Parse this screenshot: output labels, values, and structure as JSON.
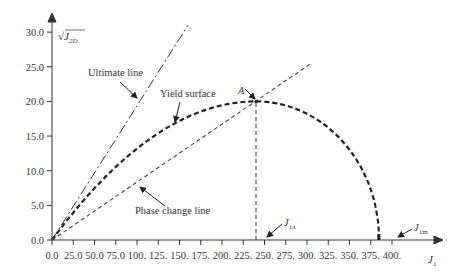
{
  "chart_data": {
    "type": "line",
    "title": "",
    "xlabel": "J1",
    "ylabel": "√J2D",
    "xlim": [
      0,
      410
    ],
    "ylim": [
      0,
      31
    ],
    "grid": false,
    "x_ticks": [
      "0.0",
      "25.0",
      "50.0",
      "75.0",
      "100.",
      "125.",
      "150.",
      "175.",
      "200.",
      "225.",
      "250.",
      "275.",
      "300.",
      "325.",
      "350.",
      "375.",
      "400."
    ],
    "x_tick_values": [
      0,
      25,
      50,
      75,
      100,
      125,
      150,
      175,
      200,
      225,
      250,
      275,
      300,
      325,
      350,
      375,
      400
    ],
    "y_ticks": [
      "0.0",
      "5.0",
      "10.0",
      "15.0",
      "20.0",
      "25.0",
      "30.0"
    ],
    "y_tick_values": [
      0,
      5,
      10,
      15,
      20,
      25,
      30
    ],
    "series": [
      {
        "name": "Ultimate line",
        "style": "dash-dot",
        "x": [
          0,
          160
        ],
        "y": [
          0,
          31
        ]
      },
      {
        "name": "Yield surface",
        "style": "thick-dashed",
        "description": "ellipse-like cap, rising from origin to peak A then falling to J1m",
        "x": [
          0,
          60,
          120,
          180,
          240,
          300,
          340,
          370,
          385
        ],
        "y": [
          0,
          8.5,
          14.5,
          18.5,
          20.0,
          18.0,
          14.0,
          8.0,
          0
        ]
      },
      {
        "name": "Phase change line",
        "style": "dashed",
        "x": [
          0,
          305
        ],
        "y": [
          0,
          25.5
        ]
      },
      {
        "name": "J1a vertical",
        "style": "dashed",
        "x": [
          240,
          240
        ],
        "y": [
          0,
          20
        ]
      }
    ],
    "annotations": [
      {
        "text": "Ultimate line",
        "x": 40,
        "y": 23.5
      },
      {
        "text": "Yield surface",
        "x": 110,
        "y": 18.5
      },
      {
        "text": "Phase change line",
        "x": 110,
        "y": 1.5
      },
      {
        "text": "A",
        "x": 230,
        "y": 21.5,
        "point": [
          240,
          20
        ]
      },
      {
        "text": "J1a",
        "x": 248,
        "y": 2.0,
        "point": [
          240,
          0
        ]
      },
      {
        "text": "J1m",
        "x": 392,
        "y": 2.0,
        "point": [
          385,
          0
        ]
      }
    ]
  }
}
